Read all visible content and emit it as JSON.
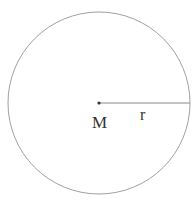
{
  "diagram": {
    "type": "circle-with-radius",
    "center_label": "M",
    "radius_label": "r",
    "stroke_color": "#a0a0a0",
    "line_color": "#888888",
    "label_color": "#333333",
    "circle": {
      "cx": 99,
      "cy": 103,
      "r": 91
    }
  }
}
